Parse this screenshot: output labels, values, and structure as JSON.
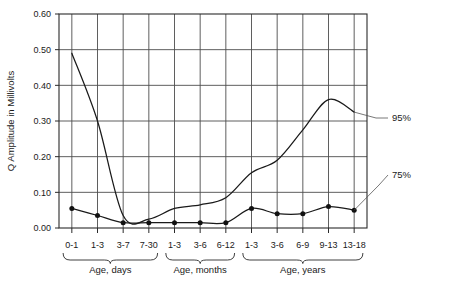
{
  "chart_data": {
    "type": "line",
    "title": "",
    "xlabel": "",
    "ylabel": "Q Amplitude in Millivolts",
    "ylim": [
      0.0,
      0.6
    ],
    "ytick_labels": [
      "0.60",
      "0.50",
      "0.40",
      "0.30",
      "0.20",
      "0.10",
      "0.00"
    ],
    "ytick_values": [
      0.6,
      0.5,
      0.4,
      0.3,
      0.2,
      0.1,
      0.0
    ],
    "grid": true,
    "legend_position": "right-annotations",
    "categories": [
      "0-1",
      "1-3",
      "3-7",
      "7-30",
      "1-3",
      "3-6",
      "6-12",
      "1-3",
      "3-6",
      "6-9",
      "9-13",
      "13-18"
    ],
    "category_groups": [
      {
        "label": "Age, days",
        "start": 0,
        "end": 3
      },
      {
        "label": "Age, months",
        "start": 4,
        "end": 6
      },
      {
        "label": "Age, years",
        "start": 7,
        "end": 11
      }
    ],
    "series": [
      {
        "name": "95%",
        "markers": false,
        "values": [
          0.49,
          0.3,
          0.035,
          0.025,
          0.055,
          0.065,
          0.085,
          0.155,
          0.19,
          0.275,
          0.36,
          0.325
        ]
      },
      {
        "name": "75%",
        "markers": true,
        "values": [
          0.055,
          0.035,
          0.015,
          0.015,
          0.015,
          0.015,
          0.015,
          0.055,
          0.04,
          0.04,
          0.06,
          0.05
        ]
      }
    ],
    "annotations": [
      {
        "label": "95%",
        "series": "95%"
      },
      {
        "label": "75%",
        "series": "75%"
      }
    ]
  },
  "caption": {
    "text": ""
  }
}
